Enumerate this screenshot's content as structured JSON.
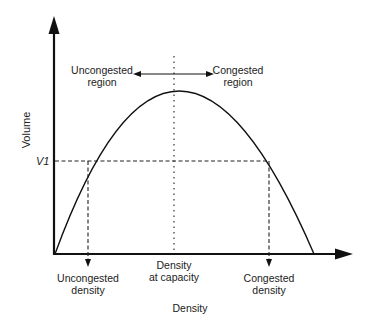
{
  "diagram": {
    "axes": {
      "x_label": "Density",
      "y_label": "Volume",
      "y_tick": "V1"
    },
    "regions": {
      "uncongested": [
        "Uncongested",
        "region"
      ],
      "congested": [
        "Congested",
        "region"
      ]
    },
    "x_markers": {
      "uncongested_density": [
        "Uncongested",
        "density"
      ],
      "density_at_capacity": [
        "Density",
        "at capacity"
      ],
      "congested_density": [
        "Congested",
        "density"
      ]
    },
    "colors": {
      "line": "#111111",
      "text": "#222222",
      "background": "#ffffff"
    }
  }
}
